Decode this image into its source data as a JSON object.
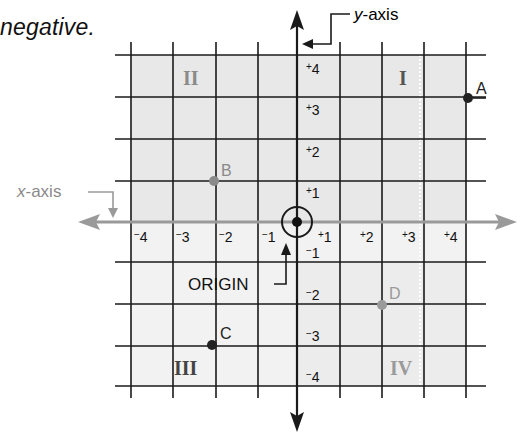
{
  "caption": "negative.",
  "diagram": {
    "y_axis_label": {
      "italic": "y",
      "rest": "-axis"
    },
    "x_axis_label": {
      "italic": "x",
      "rest": "-axis"
    },
    "origin_label": "ORIGIN",
    "quadrants": [
      {
        "name": "I",
        "color": "#555555"
      },
      {
        "name": "II",
        "color": "#8a8a8a"
      },
      {
        "name": "III",
        "color": "#444444"
      },
      {
        "name": "IV",
        "color": "#9a9a9a"
      }
    ],
    "x_ticks": [
      "-4",
      "-3",
      "-2",
      "-1",
      "+1",
      "+2",
      "+3",
      "+4"
    ],
    "y_ticks": [
      "+4",
      "+3",
      "+2",
      "+1",
      "-1",
      "-2",
      "-3",
      "-4"
    ],
    "points": [
      {
        "label": "A",
        "x": 4,
        "y": 3,
        "color": "#222222"
      },
      {
        "label": "B",
        "x": -2,
        "y": 1,
        "color": "#8a8a8a"
      },
      {
        "label": "C",
        "x": -2,
        "y": -3,
        "color": "#222222"
      },
      {
        "label": "D",
        "x": 2,
        "y": -2,
        "color": "#9a9a9a"
      }
    ],
    "colors": {
      "grid": "#1a1a1a",
      "x_axis": "#9a9a9a",
      "y_axis": "#1a1a1a",
      "shaded_fill": "#e9e9e9",
      "light_fill": "#f3f3f3"
    }
  }
}
